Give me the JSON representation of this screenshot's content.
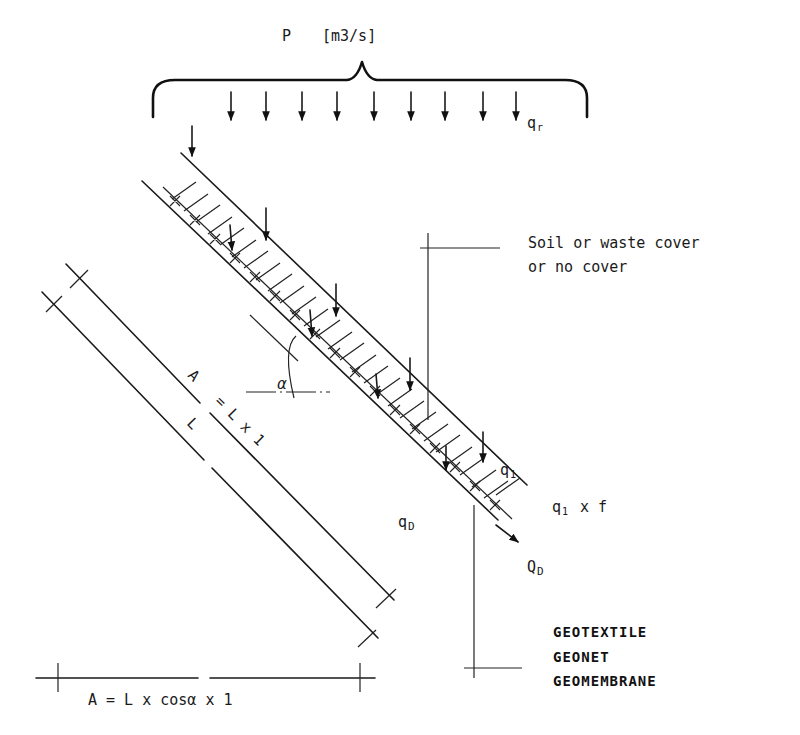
{
  "precipitation": {
    "label_symbol": "P",
    "label_unit": "[m3/s]",
    "rain_label": "q",
    "rain_label_sub": "r",
    "arrow_count": 9
  },
  "cover_callout": {
    "line1": "Soil or waste cover",
    "line2": "or no cover"
  },
  "flow_labels": {
    "infiltration": "q",
    "infiltration_sub": "1",
    "reduced_infiltration": "q",
    "reduced_infiltration_sub": "1",
    "reduced_factor": "x f",
    "drainage_rate": "q",
    "drainage_rate_sub": "D",
    "drainage_flow": "Q",
    "drainage_flow_sub": "D"
  },
  "angle": {
    "symbol": "α"
  },
  "dimensions": {
    "inclined_area_A": "A",
    "inclined_area_eq": "= L x 1",
    "slope_length": "L",
    "horizontal_area": "A = L x cosα x 1"
  },
  "layers_callout": {
    "items": [
      "GEOTEXTILE",
      "GEONET",
      "GEOMEMBRANE"
    ]
  },
  "colors": {
    "line": "#1a1a1a",
    "background": "#ffffff"
  }
}
